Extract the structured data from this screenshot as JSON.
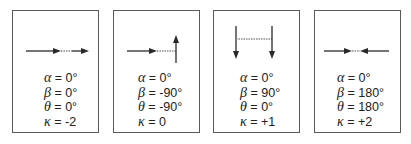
{
  "figure": {
    "line_color": "#2a2a2a",
    "dotted_color": "#8a8a8a",
    "border_color": "#5a5a5a",
    "panels": [
      {
        "id": "panel-1",
        "description": "two collinear arrows pointing right, joined by dotted segment",
        "params": [
          {
            "symbol": "α",
            "eq": " = ",
            "value": "0°"
          },
          {
            "symbol": "β",
            "eq": " = ",
            "value": "0°"
          },
          {
            "symbol": "θ",
            "eq": " = ",
            "value": "0°"
          },
          {
            "symbol": "κ",
            "eq": " = ",
            "value": "-2"
          }
        ]
      },
      {
        "id": "panel-2",
        "description": "right-pointing arrow, dotted segment, upward arrow",
        "params": [
          {
            "symbol": "α",
            "eq": " = ",
            "value": "0°"
          },
          {
            "symbol": "β",
            "eq": " = ",
            "value": "-90°"
          },
          {
            "symbol": "θ",
            "eq": " = ",
            "value": "-90°"
          },
          {
            "symbol": "κ",
            "eq": " = ",
            "value": "0"
          }
        ]
      },
      {
        "id": "panel-3",
        "description": "two parallel downward arrows joined by dotted segment",
        "params": [
          {
            "symbol": "α",
            "eq": " = ",
            "value": "0°"
          },
          {
            "symbol": "β",
            "eq": " = ",
            "value": "90°"
          },
          {
            "symbol": "θ",
            "eq": " = ",
            "value": "0°"
          },
          {
            "symbol": "κ",
            "eq": " = ",
            "value": "+1"
          }
        ]
      },
      {
        "id": "panel-4",
        "description": "two collinear arrows pointing toward each other",
        "params": [
          {
            "symbol": "α",
            "eq": " = ",
            "value": "0°"
          },
          {
            "symbol": "β",
            "eq": " = ",
            "value": "180°"
          },
          {
            "symbol": "θ",
            "eq": " = ",
            "value": "180°"
          },
          {
            "symbol": "κ",
            "eq": " = ",
            "value": "+2"
          }
        ]
      }
    ]
  }
}
